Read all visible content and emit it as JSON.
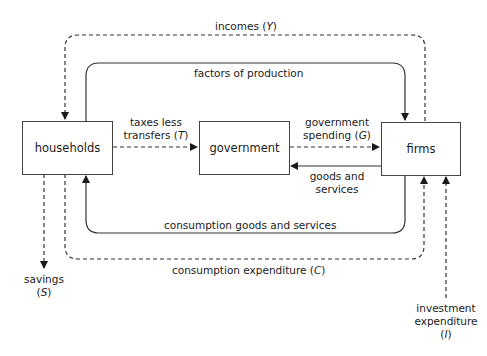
{
  "nodes": {
    "households": {
      "label": "households"
    },
    "government": {
      "label": "government"
    },
    "firms": {
      "label": "firms"
    }
  },
  "flows": {
    "incomes": {
      "text": "incomes (",
      "var": "Y",
      "close": ")",
      "style": "dashed",
      "from": "firms",
      "to": "households"
    },
    "factors": {
      "text": "factors of production",
      "style": "solid",
      "from": "households",
      "to": "firms"
    },
    "taxes": {
      "line1": "taxes less",
      "line2": "transfers (",
      "var": "T",
      "close": ")",
      "style": "dashed",
      "from": "households",
      "to": "government"
    },
    "gov_spending": {
      "line1": "government",
      "line2": "spending (",
      "var": "G",
      "close": ")",
      "style": "dashed",
      "from": "government",
      "to": "firms"
    },
    "gov_goods": {
      "line1": "goods and",
      "line2": "services",
      "style": "solid",
      "from": "firms",
      "to": "government"
    },
    "consumption_goods": {
      "text": "consumption goods and services",
      "style": "solid",
      "from": "firms",
      "to": "households"
    },
    "consumption_expenditure": {
      "text": "consumption expenditure (",
      "var": "C",
      "close": ")",
      "style": "dashed",
      "from": "households",
      "to": "firms"
    },
    "savings": {
      "line1": "savings",
      "line2": "(",
      "var": "S",
      "close": ")",
      "style": "dashed",
      "from": "households",
      "to": "out"
    },
    "investment": {
      "line1": "investment",
      "line2": "expenditure",
      "line3": "(",
      "var": "I",
      "close": ")",
      "style": "dashed",
      "from": "out",
      "to": "firms"
    }
  },
  "colors": {
    "line": "#333333",
    "box_border": "#444444",
    "text": "#1a1a1a"
  }
}
